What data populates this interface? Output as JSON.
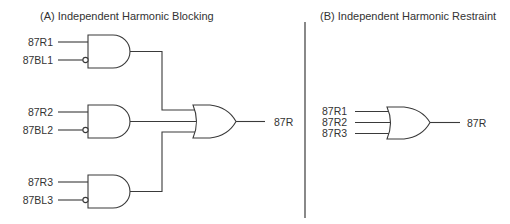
{
  "panel_a": {
    "title": "(A) Independent Harmonic Blocking",
    "gates": [
      {
        "type": "AND",
        "inputs": [
          {
            "label": "87R1",
            "inverted": false
          },
          {
            "label": "87BL1",
            "inverted": true
          }
        ]
      },
      {
        "type": "AND",
        "inputs": [
          {
            "label": "87R2",
            "inverted": false
          },
          {
            "label": "87BL2",
            "inverted": true
          }
        ]
      },
      {
        "type": "AND",
        "inputs": [
          {
            "label": "87R3",
            "inverted": false
          },
          {
            "label": "87BL3",
            "inverted": true
          }
        ]
      }
    ],
    "or_gate": {
      "type": "OR",
      "output_label": "87R"
    }
  },
  "panel_b": {
    "title": "(B) Independent Harmonic Restraint",
    "or_gate": {
      "type": "OR",
      "inputs": [
        "87R1",
        "87R2",
        "87R3"
      ],
      "output_label": "87R"
    }
  },
  "colors": {
    "line": "#3a3a3a",
    "text": "#333333",
    "background": "#ffffff"
  }
}
